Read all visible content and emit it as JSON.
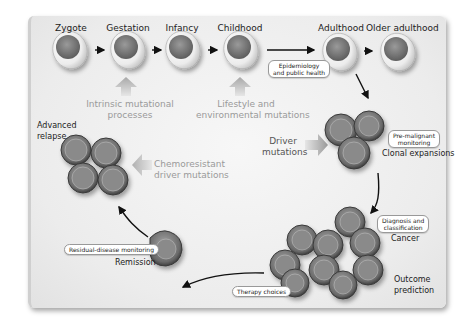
{
  "diagram": {
    "type": "lifecycle-flow",
    "colorscheme": "grayscale",
    "colors": {
      "panel_bg": "#ececec",
      "arrow": "#111111",
      "grey_arrow": "#b0b0b0",
      "cell_fill": "#7a7a7a",
      "cell_border": "#3a3a3a",
      "egg_shell": "#f4f4f4"
    }
  },
  "life_stages": [
    {
      "label": "Zygote"
    },
    {
      "label": "Gestation"
    },
    {
      "label": "Infancy"
    },
    {
      "label": "Childhood"
    },
    {
      "label": "Adulthood"
    },
    {
      "label": "Older adulthood"
    }
  ],
  "influences": {
    "intrinsic": {
      "line1": "Intrinsic mutational",
      "line2": "processes"
    },
    "lifestyle": {
      "line1": "Lifestyle and",
      "line2": "environmental mutations"
    },
    "driver": {
      "line1": "Driver",
      "line2": "mutations"
    },
    "chemoresistant": {
      "line1": "Chemoresistant",
      "line2": "driver mutations"
    }
  },
  "stages": {
    "clonal": {
      "label": "Clonal expansions"
    },
    "cancer": {
      "label": "Cancer"
    },
    "outcome": {
      "line1": "Outcome",
      "line2": "prediction"
    },
    "remission": {
      "label": "Remission"
    },
    "relapse": {
      "line1": "Advanced",
      "line2": "relapse"
    }
  },
  "interventions": {
    "epidemiology": {
      "line1": "Epidemiology",
      "line2": "and public health"
    },
    "premalignant": {
      "line1": "Pre-malignant",
      "line2": "monitoring"
    },
    "diagnosis": {
      "line1": "Diagnosis and",
      "line2": "classification"
    },
    "therapy": {
      "label": "Therapy choices"
    },
    "residual": {
      "label": "Residual-disease monitoring"
    }
  }
}
